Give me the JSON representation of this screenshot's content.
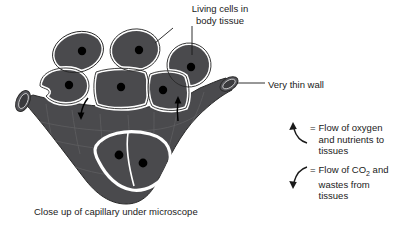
{
  "diagram": {
    "title_label": "Living cells in\nbody tissue",
    "wall_label": "Very thin wall",
    "caption": "Close up of capillary under microscope",
    "colors": {
      "cell_fill": "#4a4a4d",
      "capillary_fill": "#4a4a4d",
      "nucleus": "#000000",
      "background": "#ffffff",
      "outline": "#2a2a2a",
      "text": "#1a1a1a"
    },
    "cells": [
      {
        "name": "tissue-cell-1",
        "cx": 78,
        "cy": 52,
        "rx": 26,
        "ry": 20,
        "rot": -18,
        "nucleus_x": 82,
        "nucleus_y": 51
      },
      {
        "name": "tissue-cell-2",
        "cx": 135,
        "cy": 50,
        "rx": 25,
        "ry": 21,
        "rot": -8,
        "nucleus_x": 139,
        "nucleus_y": 50
      },
      {
        "name": "tissue-cell-3",
        "cx": 189,
        "cy": 65,
        "rx": 22,
        "ry": 22,
        "rot": 5,
        "nucleus_x": 191,
        "nucleus_y": 67
      },
      {
        "name": "tissue-cell-4",
        "cx": 64,
        "cy": 86,
        "rx": 25,
        "ry": 18,
        "rot": -5,
        "nucleus_x": 69,
        "nucleus_y": 85
      },
      {
        "name": "tissue-cell-5",
        "cx": 121,
        "cy": 88,
        "rx": 27,
        "ry": 20,
        "rot": 0,
        "nucleus_x": 122,
        "nucleus_y": 87
      },
      {
        "name": "tissue-cell-6",
        "cx": 167,
        "cy": 91,
        "rx": 21,
        "ry": 19,
        "rot": 0,
        "nucleus_x": 163,
        "nucleus_y": 90
      }
    ],
    "lumen_nuclei": [
      {
        "name": "capillary-nucleus-1",
        "x": 119,
        "y": 155
      },
      {
        "name": "capillary-nucleus-2",
        "x": 143,
        "y": 163
      }
    ]
  },
  "legend": {
    "equals": "=",
    "items": [
      {
        "icon": "arrow-up-curved-icon",
        "text": "Flow of oxygen\nand nutrients to\ntissues"
      },
      {
        "icon": "arrow-down-curved-icon",
        "text_before": "Flow of CO",
        "subscript": "2",
        "text_after": " and\nwastes from\ntissues"
      }
    ]
  }
}
